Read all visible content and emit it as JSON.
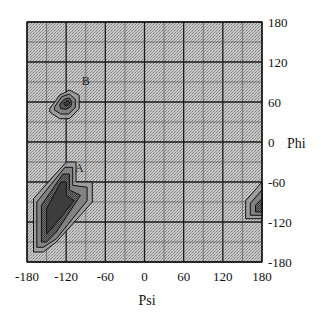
{
  "chart_data": {
    "type": "heatmap",
    "title": "",
    "xlabel": "Psi",
    "ylabel": "Phi",
    "xlim": [
      -180,
      180
    ],
    "ylim": [
      -180,
      180
    ],
    "x_ticks": [
      -180,
      -120,
      -60,
      0,
      60,
      120,
      180
    ],
    "y_ticks": [
      180,
      120,
      60,
      0,
      -60,
      -120,
      -180
    ],
    "x_tick_labels": [
      "-180",
      "-120",
      "-60",
      "0",
      "60",
      "120",
      "180"
    ],
    "y_tick_labels": [
      "180",
      "120",
      "60",
      "0",
      "-60",
      "-120",
      "-180"
    ],
    "grid": true,
    "grid_minor_step": 30,
    "grid_major_step": 60,
    "y_axis_position": "right",
    "background_shading": "stippled gray",
    "regions": [
      {
        "label": "A",
        "label_pos": [
          -100,
          -45
        ],
        "description": "large contour region, lower-left",
        "center": [
          -145,
          -105
        ],
        "contours": [
          [
            [
              -170,
              -85
            ],
            [
              -120,
              -30
            ],
            [
              -105,
              -30
            ],
            [
              -105,
              -60
            ],
            [
              -80,
              -60
            ],
            [
              -80,
              -90
            ],
            [
              -135,
              -150
            ],
            [
              -155,
              -165
            ],
            [
              -170,
              -165
            ]
          ],
          [
            [
              -165,
              -90
            ],
            [
              -122,
              -38
            ],
            [
              -110,
              -38
            ],
            [
              -110,
              -65
            ],
            [
              -88,
              -68
            ],
            [
              -88,
              -88
            ],
            [
              -135,
              -145
            ],
            [
              -155,
              -158
            ],
            [
              -165,
              -158
            ]
          ],
          [
            [
              -158,
              -95
            ],
            [
              -125,
              -48
            ],
            [
              -115,
              -48
            ],
            [
              -115,
              -72
            ],
            [
              -98,
              -80
            ],
            [
              -135,
              -135
            ],
            [
              -150,
              -150
            ],
            [
              -158,
              -150
            ]
          ],
          [
            [
              -150,
              -100
            ],
            [
              -128,
              -60
            ],
            [
              -120,
              -60
            ],
            [
              -120,
              -80
            ],
            [
              -108,
              -88
            ],
            [
              -138,
              -125
            ],
            [
              -150,
              -138
            ]
          ]
        ]
      },
      {
        "label": "B",
        "label_pos": [
          -90,
          85
        ],
        "description": "small contour region, upper-left",
        "center": [
          -120,
          60
        ],
        "contours": [
          [
            [
              -145,
              50
            ],
            [
              -130,
              70
            ],
            [
              -115,
              78
            ],
            [
              -100,
              70
            ],
            [
              -100,
              50
            ],
            [
              -115,
              35
            ],
            [
              -130,
              35
            ],
            [
              -145,
              45
            ]
          ],
          [
            [
              -138,
              52
            ],
            [
              -127,
              68
            ],
            [
              -115,
              72
            ],
            [
              -106,
              64
            ],
            [
              -106,
              52
            ],
            [
              -116,
              42
            ],
            [
              -128,
              42
            ],
            [
              -138,
              48
            ]
          ],
          [
            [
              -130,
              56
            ],
            [
              -123,
              64
            ],
            [
              -115,
              66
            ],
            [
              -111,
              60
            ],
            [
              -113,
              53
            ],
            [
              -120,
              49
            ],
            [
              -128,
              50
            ]
          ],
          [
            [
              -124,
              58
            ],
            [
              -118,
              62
            ],
            [
              -114,
              59
            ],
            [
              -117,
              55
            ],
            [
              -122,
              55
            ]
          ]
        ]
      },
      {
        "label": "",
        "description": "partial contour at right edge",
        "center": [
          175,
          -95
        ],
        "contours": [
          [
            [
              180,
              -60
            ],
            [
              155,
              -88
            ],
            [
              155,
              -115
            ],
            [
              180,
              -115
            ]
          ],
          [
            [
              180,
              -72
            ],
            [
              162,
              -92
            ],
            [
              162,
              -110
            ],
            [
              180,
              -110
            ]
          ],
          [
            [
              180,
              -85
            ],
            [
              170,
              -95
            ],
            [
              170,
              -105
            ],
            [
              180,
              -105
            ]
          ]
        ]
      }
    ]
  }
}
